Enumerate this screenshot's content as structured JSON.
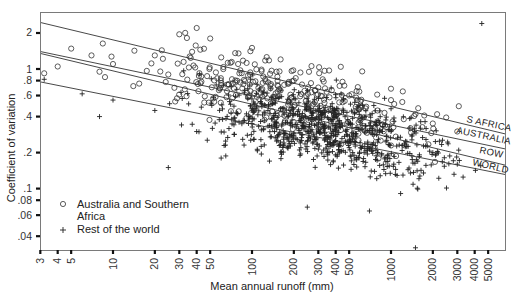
{
  "chart_data": {
    "type": "scatter",
    "title": "",
    "xlabel": "Mean annual runoff (mm)",
    "ylabel": "Coefficient of variation",
    "xscale": "log",
    "yscale": "log",
    "xlim": [
      3,
      6500
    ],
    "ylim": [
      0.03,
      3.0
    ],
    "grid": false,
    "x_ticks": [
      3,
      4,
      5,
      10,
      20,
      30,
      40,
      50,
      100,
      200,
      300,
      400,
      500,
      1000,
      2000,
      3000,
      4000,
      5000
    ],
    "x_tick_labels": [
      "3",
      "4",
      "5",
      "10",
      "20",
      "30",
      "40",
      "50",
      "100",
      "200",
      "300",
      "400",
      "500",
      "1000",
      "2000",
      "3000",
      "4000",
      "5000"
    ],
    "y_ticks": [
      2,
      1,
      0.8,
      0.6,
      0.4,
      0.2,
      0.1,
      0.08,
      0.06,
      0.04
    ],
    "y_tick_labels": [
      "2",
      "1",
      ".8",
      ".6",
      ".4",
      ".2",
      ".1",
      ".08",
      ".06",
      ".04"
    ],
    "legend": {
      "position": "lower-left",
      "entries": [
        {
          "marker": "o",
          "label_line1": "Australia and Southern",
          "label_line2": "Africa"
        },
        {
          "marker": "+",
          "label_line1": "Rest of the world",
          "label_line2": ""
        }
      ]
    },
    "regression_lines": [
      {
        "name": "S AFRICA",
        "x": [
          3,
          5000
        ],
        "y": [
          2.45,
          0.31
        ]
      },
      {
        "name": "AUSTRALIA",
        "x": [
          3,
          5000
        ],
        "y": [
          1.4,
          0.23
        ]
      },
      {
        "name": "ROW",
        "x": [
          3,
          5000
        ],
        "y": [
          1.35,
          0.17
        ]
      },
      {
        "name": "WORLD",
        "x": [
          3,
          5000
        ],
        "y": [
          0.78,
          0.14
        ]
      }
    ],
    "series": [
      {
        "name": "Australia and Southern Africa",
        "marker": "circle",
        "approx_count": 420,
        "sample_points": [
          [
            3.2,
            0.92
          ],
          [
            4,
            1.05
          ],
          [
            5,
            1.48
          ],
          [
            7,
            1.3
          ],
          [
            8,
            0.95
          ],
          [
            10,
            1.1
          ],
          [
            14,
            0.72
          ],
          [
            20,
            1.3
          ],
          [
            25,
            0.9
          ],
          [
            30,
            1.95
          ],
          [
            40,
            2.2
          ],
          [
            45,
            2.9
          ],
          [
            50,
            1.8
          ],
          [
            60,
            1.25
          ],
          [
            80,
            1.35
          ],
          [
            100,
            1.5
          ],
          [
            150,
            0.95
          ],
          [
            200,
            0.8
          ],
          [
            300,
            0.7
          ],
          [
            500,
            0.6
          ],
          [
            800,
            0.45
          ],
          [
            1000,
            0.55
          ],
          [
            1500,
            0.42
          ],
          [
            2000,
            0.35
          ],
          [
            3000,
            0.3
          ]
        ]
      },
      {
        "name": "Rest of the world",
        "marker": "plus",
        "approx_count": 900,
        "sample_points": [
          [
            3.2,
            0.82
          ],
          [
            6,
            0.62
          ],
          [
            8,
            0.4
          ],
          [
            10,
            0.55
          ],
          [
            20,
            0.45
          ],
          [
            25,
            0.15
          ],
          [
            40,
            0.3
          ],
          [
            60,
            0.18
          ],
          [
            100,
            0.35
          ],
          [
            150,
            0.25
          ],
          [
            200,
            0.28
          ],
          [
            300,
            0.3
          ],
          [
            400,
            0.25
          ],
          [
            500,
            0.22
          ],
          [
            800,
            0.2
          ],
          [
            1000,
            0.3
          ],
          [
            1500,
            0.032
          ],
          [
            2000,
            0.2
          ],
          [
            3000,
            0.16
          ],
          [
            4500,
            2.4
          ],
          [
            700,
            0.065
          ],
          [
            250,
            0.07
          ]
        ]
      }
    ]
  },
  "labels": {
    "xlabel": "Mean annual runoff (mm)",
    "ylabel": "Coefficient of variation",
    "legend_circle_1": "Australia and Southern",
    "legend_circle_2": "Africa",
    "legend_plus": "Rest of the world",
    "line_safrica": "S AFRICA",
    "line_australia": "AUSTRALIA",
    "line_row": "ROW",
    "line_world": "WORLD"
  }
}
